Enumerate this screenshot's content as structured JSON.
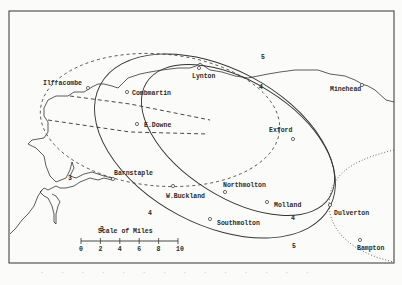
{
  "map": {
    "towns": [
      {
        "name": "Ilfracombe",
        "x": 88,
        "y": 88,
        "lx": 43,
        "ly": 85
      },
      {
        "name": "Combmartin",
        "x": 127,
        "y": 92,
        "lx": 132,
        "ly": 95
      },
      {
        "name": "Lynton",
        "x": 199,
        "y": 68,
        "lx": 192,
        "ly": 78
      },
      {
        "name": "Minehead",
        "x": 362,
        "y": 85,
        "lx": 330,
        "ly": 91
      },
      {
        "name": "E.Downe",
        "x": 137,
        "y": 124,
        "lx": 144,
        "ly": 127
      },
      {
        "name": "Exford",
        "x": 293,
        "y": 139,
        "lx": 269,
        "ly": 132
      },
      {
        "name": "Barnstaple",
        "x": 113,
        "y": 179,
        "lx": 114,
        "ly": 175
      },
      {
        "name": "W.Buckland",
        "x": 173,
        "y": 186,
        "lx": 166,
        "ly": 198
      },
      {
        "name": "Northmolton",
        "x": 225,
        "y": 192,
        "lx": 223,
        "ly": 187
      },
      {
        "name": "Molland",
        "x": 267,
        "y": 202,
        "lx": 274,
        "ly": 207
      },
      {
        "name": "Dulverton",
        "x": 330,
        "y": 205,
        "lx": 334,
        "ly": 215
      },
      {
        "name": "Southmolton",
        "x": 210,
        "y": 219,
        "lx": 217,
        "ly": 225
      },
      {
        "name": "Bampton",
        "x": 360,
        "y": 240,
        "lx": 357,
        "ly": 250
      }
    ],
    "contour_labels": [
      {
        "text": "5",
        "x": 261,
        "y": 59
      },
      {
        "text": "4",
        "x": 259,
        "y": 89
      },
      {
        "text": "3",
        "x": 100,
        "y": 231
      },
      {
        "text": "4",
        "x": 148,
        "y": 215
      },
      {
        "text": "3",
        "x": 68,
        "y": 180
      },
      {
        "text": "4",
        "x": 291,
        "y": 220
      },
      {
        "text": "5",
        "x": 292,
        "y": 248
      }
    ],
    "scale": {
      "title": "Scale of Miles",
      "ticks": [
        "0",
        "2",
        "4",
        "6",
        "8",
        "10"
      ]
    }
  },
  "caption": "faint illegible caption text"
}
